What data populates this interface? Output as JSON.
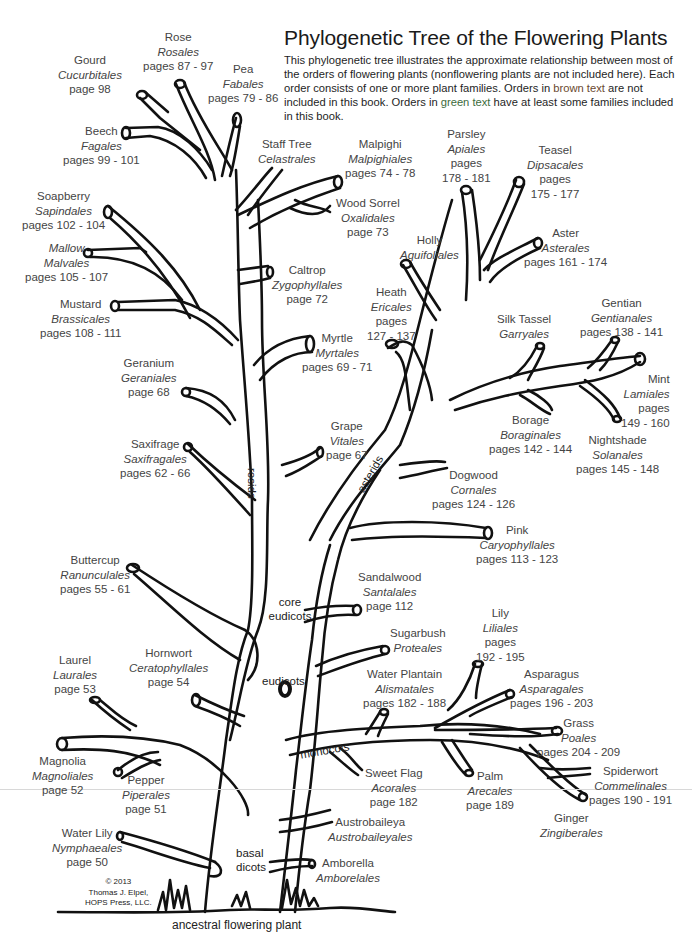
{
  "header": {
    "title": "Phylogenetic Tree of the Flowering Plants",
    "description_parts": [
      "This phylogenetic tree illustrates the approximate relationship between most of the orders of flowering plants (nonflowering plants are not included here). Each order consists of one or more plant families. Orders in ",
      "brown text",
      " are not included in this book. Orders in ",
      "green text",
      " have at least some families included in this book."
    ]
  },
  "colors": {
    "line": "#111111",
    "label_text": "#444444",
    "brown_text": "#6b4a30",
    "green_text": "#3c6b3c"
  },
  "clades": {
    "rosids": "rosids",
    "asterids": "asterids",
    "core_eudicots_1": "core",
    "core_eudicots_2": "eudicots",
    "eudicots": "eudicots",
    "monocots": "monocots",
    "basal_dicots_1": "basal",
    "basal_dicots_2": "dicots",
    "root": "ancestral flowering plant"
  },
  "copyright": {
    "line1": "© 2013",
    "line2": "Thomas J. Elpel,",
    "line3": "HOPS Press, LLC."
  },
  "orders": [
    {
      "id": "gourd",
      "common": "Gourd",
      "order": "Cucurbitales",
      "pages": "page 98"
    },
    {
      "id": "rose",
      "common": "Rose",
      "order": "Rosales",
      "pages": "pages 87 - 97"
    },
    {
      "id": "pea",
      "common": "Pea",
      "order": "Fabales",
      "pages": "pages 79 - 86"
    },
    {
      "id": "beech",
      "common": "Beech",
      "order": "Fagales",
      "pages": "pages 99 - 101"
    },
    {
      "id": "staff-tree",
      "common": "Staff Tree",
      "order": "Celastrales",
      "pages": ""
    },
    {
      "id": "malpighi",
      "common": "Malpighi",
      "order": "Malpighiales",
      "pages": "pages 74 - 78"
    },
    {
      "id": "wood-sorrel",
      "common": "Wood Sorrel",
      "order": "Oxalidales",
      "pages": "page 73"
    },
    {
      "id": "parsley",
      "common": "Parsley",
      "order": "Apiales",
      "pages": "pages",
      "pages2": "178 - 181"
    },
    {
      "id": "teasel",
      "common": "Teasel",
      "order": "Dipsacales",
      "pages": "pages",
      "pages2": "175 - 177"
    },
    {
      "id": "soapberry",
      "common": "Soapberry",
      "order": "Sapindales",
      "pages": "pages 102 - 104"
    },
    {
      "id": "mallow",
      "common": "Mallow",
      "order": "Malvales",
      "pages": "pages 105 - 107"
    },
    {
      "id": "holly",
      "common": "Holly",
      "order": "Aquifoliales",
      "pages": ""
    },
    {
      "id": "aster",
      "common": "Aster",
      "order": "Asterales",
      "pages": "pages 161 - 174"
    },
    {
      "id": "caltrop",
      "common": "Caltrop",
      "order": "Zygophyllales",
      "pages": "page 72"
    },
    {
      "id": "heath",
      "common": "Heath",
      "order": "Ericales",
      "pages": "pages",
      "pages2": "127 - 137"
    },
    {
      "id": "mustard",
      "common": "Mustard",
      "order": "Brassicales",
      "pages": "pages 108 - 111"
    },
    {
      "id": "silk-tassel",
      "common": "Silk Tassel",
      "order": "Garryales",
      "pages": ""
    },
    {
      "id": "gentian",
      "common": "Gentian",
      "order": "Gentianales",
      "pages": "pages 138 - 141"
    },
    {
      "id": "myrtle",
      "common": "Myrtle",
      "order": "Myrtales",
      "pages": "pages 69 - 71"
    },
    {
      "id": "geranium",
      "common": "Geranium",
      "order": "Geraniales",
      "pages": "page 68"
    },
    {
      "id": "mint",
      "common": "Mint",
      "order": "Lamiales",
      "pages": "pages",
      "pages2": "149 - 160"
    },
    {
      "id": "saxifrage",
      "common": "Saxifrage",
      "order": "Saxifragales",
      "pages": "pages 62 - 66"
    },
    {
      "id": "grape",
      "common": "Grape",
      "order": "Vitales",
      "pages": "page 67"
    },
    {
      "id": "borage",
      "common": "Borage",
      "order": "Boraginales",
      "pages": "pages 142 - 144"
    },
    {
      "id": "nightshade",
      "common": "Nightshade",
      "order": "Solanales",
      "pages": "pages 145 - 148"
    },
    {
      "id": "dogwood",
      "common": "Dogwood",
      "order": "Cornales",
      "pages": "pages 124 - 126"
    },
    {
      "id": "pink",
      "common": "Pink",
      "order": "Caryophyllales",
      "pages": "pages 113 - 123"
    },
    {
      "id": "buttercup",
      "common": "Buttercup",
      "order": "Ranunculales",
      "pages": "pages 55 - 61"
    },
    {
      "id": "sandalwood",
      "common": "Sandalwood",
      "order": "Santalales",
      "pages": "page 112"
    },
    {
      "id": "sugarbush",
      "common": "Sugarbush",
      "order": "Proteales",
      "pages": ""
    },
    {
      "id": "lily",
      "common": "Lily",
      "order": "Liliales",
      "pages": "pages",
      "pages2": "192 - 195"
    },
    {
      "id": "laurel",
      "common": "Laurel",
      "order": "Laurales",
      "pages": "page 53"
    },
    {
      "id": "hornwort",
      "common": "Hornwort",
      "order": "Ceratophyllales",
      "pages": "page 54"
    },
    {
      "id": "water-plantain",
      "common": "Water Plantain",
      "order": "Alismatales",
      "pages": "pages 182 - 188"
    },
    {
      "id": "asparagus",
      "common": "Asparagus",
      "order": "Asparagales",
      "pages": "pages 196 - 203"
    },
    {
      "id": "grass",
      "common": "Grass",
      "order": "Poales",
      "pages": "pages 204 - 209"
    },
    {
      "id": "magnolia",
      "common": "Magnolia",
      "order": "Magnoliales",
      "pages": "page 52"
    },
    {
      "id": "pepper",
      "common": "Pepper",
      "order": "Piperales",
      "pages": "page 51"
    },
    {
      "id": "sweet-flag",
      "common": "Sweet Flag",
      "order": "Acorales",
      "pages": "page 182"
    },
    {
      "id": "palm",
      "common": "Palm",
      "order": "Arecales",
      "pages": "page 189"
    },
    {
      "id": "spiderwort",
      "common": "Spiderwort",
      "order": "Commelinales",
      "pages": "pages 190 - 191"
    },
    {
      "id": "ginger",
      "common": "Ginger",
      "order": "Zingiberales",
      "pages": ""
    },
    {
      "id": "austrobaileya",
      "common": "Austrobaileya",
      "order": "Austrobaileyales",
      "pages": ""
    },
    {
      "id": "water-lily",
      "common": "Water Lily",
      "order": "Nymphaeales",
      "pages": "page 50"
    },
    {
      "id": "amborella",
      "common": "Amborella",
      "order": "Amborelales",
      "pages": ""
    }
  ]
}
